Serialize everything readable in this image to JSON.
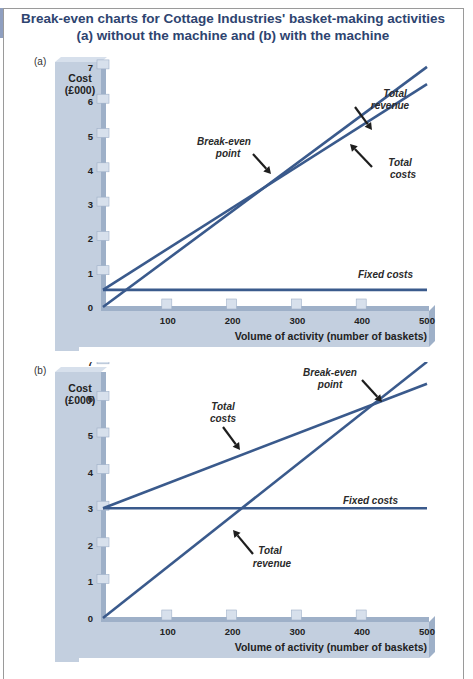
{
  "title_line1": "Break-even charts for Cottage Industries' basket-making activities",
  "title_line2": "(a) without the machine and (b) with the machine",
  "colors": {
    "title": "#2e4470",
    "line": "#3a5a8c",
    "axis_panel": "#c3cfdf",
    "axis_shadow": "#9eb0c8",
    "arrow": "#1e1e1e"
  },
  "panels": [
    {
      "label": "(a)",
      "ylabel_line1": "Cost",
      "ylabel_line2": "(£000)",
      "xlabel": "Volume of activity (number of baskets)",
      "annotations": {
        "total_revenue_1": "Total",
        "total_revenue_2": "revenue",
        "break_even_1": "Break-even",
        "break_even_2": "point",
        "total_costs_1": "Total",
        "total_costs_2": "costs",
        "fixed_costs": "Fixed costs"
      }
    },
    {
      "label": "(b)",
      "ylabel_line1": "Cost",
      "ylabel_line2": "(£000)",
      "xlabel": "Volume of activity (number of baskets)",
      "annotations": {
        "total_revenue_1": "Total",
        "total_revenue_2": "revenue",
        "break_even_1": "Break-even",
        "break_even_2": "point",
        "total_costs_1": "Total",
        "total_costs_2": "costs",
        "fixed_costs": "Fixed costs"
      }
    }
  ],
  "chart_data": [
    {
      "type": "line",
      "title": "(a) without the machine",
      "xlabel": "Volume of activity (number of baskets)",
      "ylabel": "Cost (£000)",
      "x_ticks": [
        100,
        200,
        300,
        400,
        500
      ],
      "y_ticks": [
        0,
        1,
        2,
        3,
        4,
        5,
        6,
        7
      ],
      "xlim": [
        0,
        500
      ],
      "ylim": [
        0,
        7
      ],
      "grid": false,
      "series": [
        {
          "name": "Total revenue",
          "x": [
            0,
            500
          ],
          "y": [
            0,
            7.0
          ]
        },
        {
          "name": "Total costs",
          "x": [
            0,
            500
          ],
          "y": [
            0.5,
            6.5
          ]
        },
        {
          "name": "Fixed costs",
          "x": [
            0,
            500
          ],
          "y": [
            0.5,
            0.5
          ]
        }
      ],
      "annotations": [
        {
          "text": "Break-even point",
          "x": 250,
          "y": 3.5
        },
        {
          "text": "Total revenue"
        },
        {
          "text": "Total costs"
        },
        {
          "text": "Fixed costs"
        }
      ]
    },
    {
      "type": "line",
      "title": "(b) with the machine",
      "xlabel": "Volume of activity (number of baskets)",
      "ylabel": "Cost (£000)",
      "x_ticks": [
        100,
        200,
        300,
        400,
        500
      ],
      "y_ticks": [
        0,
        1,
        2,
        3,
        4,
        5,
        6,
        7
      ],
      "xlim": [
        0,
        500
      ],
      "ylim": [
        0,
        7
      ],
      "grid": false,
      "series": [
        {
          "name": "Total revenue",
          "x": [
            0,
            500
          ],
          "y": [
            0,
            7.0
          ]
        },
        {
          "name": "Total costs",
          "x": [
            0,
            500
          ],
          "y": [
            3.0,
            6.4
          ]
        },
        {
          "name": "Fixed costs",
          "x": [
            0,
            500
          ],
          "y": [
            3.0,
            3.0
          ]
        }
      ],
      "annotations": [
        {
          "text": "Break-even point",
          "x": 440,
          "y": 6.0
        },
        {
          "text": "Total revenue"
        },
        {
          "text": "Total costs"
        },
        {
          "text": "Fixed costs"
        }
      ]
    }
  ]
}
